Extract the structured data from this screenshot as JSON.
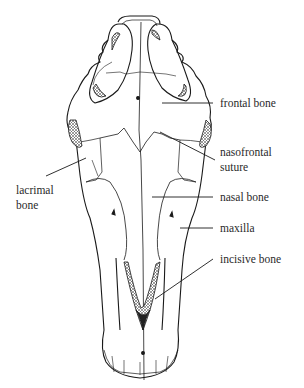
{
  "labels": {
    "frontal_bone": "frontal bone",
    "nasofrontal_suture_line1": "nasofrontal",
    "nasofrontal_suture_line2": "suture",
    "lacrimal_bone_line1": "lacrimal",
    "lacrimal_bone_line2": "bone",
    "nasal_bone": "nasal bone",
    "maxilla": "maxilla",
    "incisive_bone": "incisive bone"
  },
  "colors": {
    "line": "#1a1a1a",
    "text": "#2a2a2a",
    "background": "#ffffff"
  }
}
